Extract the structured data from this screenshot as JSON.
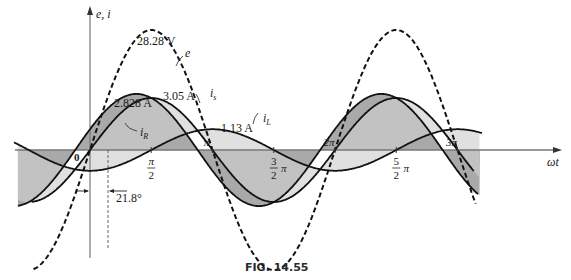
{
  "figure": {
    "caption": "FIG. 14.55",
    "axes": {
      "y_label": "e, i",
      "x_label": "ωt",
      "origin_label": "0"
    },
    "x_ticks": [
      {
        "label_num": "π",
        "label_den": "2",
        "pos": 0.5
      },
      {
        "label": "π",
        "pos": 1.0
      },
      {
        "label_num": "3",
        "label_den": "2",
        "suffix": "π",
        "pos": 1.5
      },
      {
        "label": "2π",
        "pos": 2.0
      },
      {
        "label_num": "5",
        "label_den": "2",
        "suffix": "π",
        "pos": 2.5
      },
      {
        "label": "3π",
        "pos": 3.0
      }
    ],
    "annotations": {
      "e_peak": "28.28 V",
      "e_name": "e",
      "iR_peak": "2.828 A",
      "iR_name": "iR",
      "is_peak": "3.05 A",
      "is_name": "is",
      "iL_peak": "1.13 A",
      "iL_name": "iL",
      "phase_angle": "21.8°"
    }
  },
  "chart_data": {
    "type": "line",
    "title": "FIG. 14.55",
    "xlabel": "ωt",
    "ylabel": "e, i",
    "x_range_rad": [
      -0.6,
      3.45
    ],
    "x_tick_labels": [
      "0",
      "π/2",
      "π",
      "3/2 π",
      "2π",
      "5/2 π",
      "3π"
    ],
    "series": [
      {
        "name": "e",
        "style": "dashed",
        "amplitude": 28.28,
        "unit": "V",
        "phase_deg": 0
      },
      {
        "name": "iR",
        "style": "solid",
        "amplitude": 2.828,
        "unit": "A",
        "phase_deg": 0
      },
      {
        "name": "is",
        "style": "solid",
        "amplitude": 3.05,
        "unit": "A",
        "phase_deg": 21.8
      },
      {
        "name": "iL",
        "style": "solid",
        "amplitude": 1.13,
        "unit": "A",
        "phase_deg": -90
      }
    ],
    "annotations": [
      "28.28 V",
      "2.828 A",
      "3.05 A",
      "1.13 A",
      "21.8°"
    ],
    "grid": false
  }
}
